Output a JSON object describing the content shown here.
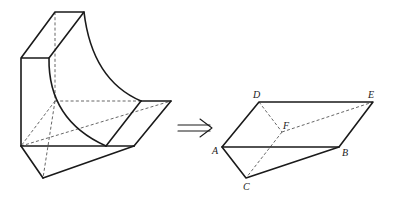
{
  "figure": {
    "arrow": "implies-arrow",
    "labels": {
      "A": "A",
      "B": "B",
      "C": "C",
      "D": "D",
      "E": "E",
      "F": "F"
    }
  }
}
